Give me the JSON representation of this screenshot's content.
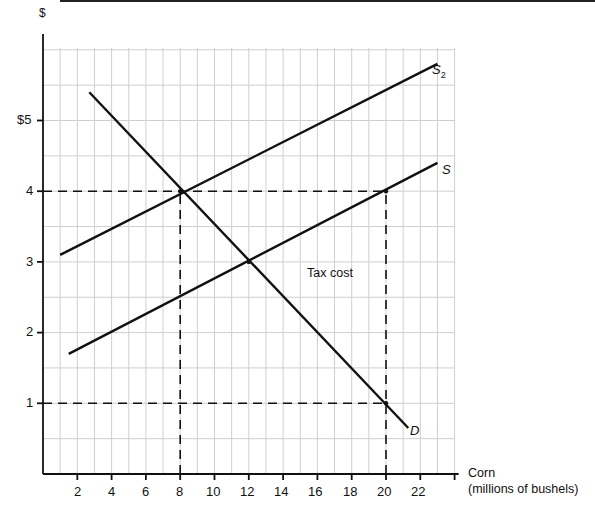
{
  "chart_data": {
    "type": "line",
    "title": "",
    "xlabel": "Corn (millions of bushels)",
    "xlabel_line1": "Corn",
    "xlabel_line2": "(millions of bushels)",
    "ylabel": "$",
    "xlim": [
      0,
      24
    ],
    "ylim": [
      0,
      6
    ],
    "grid": true,
    "x_ticks": [
      "2",
      "4",
      "6",
      "8",
      "10",
      "12",
      "14",
      "16",
      "18",
      "20",
      "22"
    ],
    "y_ticks": [
      "1",
      "2",
      "3",
      "4",
      "$5"
    ],
    "series": [
      {
        "name": "S2",
        "points": [
          [
            1,
            3.1
          ],
          [
            23,
            5.8
          ]
        ]
      },
      {
        "name": "S",
        "points": [
          [
            1.5,
            1.7
          ],
          [
            23,
            4.4
          ]
        ]
      },
      {
        "name": "D",
        "points": [
          [
            2.7,
            5.4
          ],
          [
            21.3,
            0.65
          ]
        ]
      }
    ],
    "reference_lines": [
      {
        "type": "horizontal",
        "y": 4,
        "x_from": 0,
        "x_to": 20,
        "style": "dashed"
      },
      {
        "type": "horizontal",
        "y": 1,
        "x_from": 0,
        "x_to": 20,
        "style": "dashed"
      },
      {
        "type": "vertical",
        "x": 8,
        "y_from": 0,
        "y_to": 4,
        "style": "dashed"
      },
      {
        "type": "vertical",
        "x": 20,
        "y_from": 0,
        "y_to": 4,
        "style": "dashed"
      }
    ],
    "annotations": [
      {
        "text": "Tax cost",
        "x": 14,
        "y": 2.85
      },
      {
        "text": "S2",
        "x": 23.3,
        "y": 5.65
      },
      {
        "text": "S",
        "x": 23.4,
        "y": 4.3
      },
      {
        "text": "D",
        "x": 21.6,
        "y": 0.5
      }
    ]
  },
  "labels": {
    "y_axis": "$",
    "x_axis_1": "Corn",
    "x_axis_2": "(millions of bushels)",
    "tax_cost": "Tax cost",
    "s2_main": "S",
    "s2_sub": "2",
    "s": "S",
    "d": "D",
    "y5": "$5",
    "y4": "4",
    "y3": "3",
    "y2": "2",
    "y1": "1",
    "x2": "2",
    "x4": "4",
    "x6": "6",
    "x8": "8",
    "x10": "10",
    "x12": "12",
    "x14": "14",
    "x16": "16",
    "x18": "18",
    "x20": "20",
    "x22": "22"
  }
}
